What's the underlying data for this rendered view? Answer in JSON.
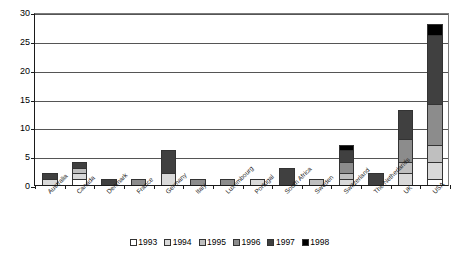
{
  "chart_data": {
    "type": "bar",
    "stacked": true,
    "title": "",
    "subtitle": "",
    "xlabel": "",
    "ylabel": "",
    "ylim": [
      0,
      30
    ],
    "yticks": [
      0,
      5,
      10,
      15,
      20,
      25,
      30
    ],
    "ytick_labels": [
      "0",
      "5",
      "10",
      "15",
      "20",
      "25",
      "30"
    ],
    "grid": true,
    "grid_axis": "y",
    "legend_position": "bottom-center",
    "categories": [
      "Australia",
      "Canada",
      "Denmark",
      "France",
      "Germany",
      "Italy",
      "Luxembourg",
      "Portugal",
      "South Africa",
      "Sweden",
      "Switzerland",
      "The Netherlands",
      "UK",
      "USA"
    ],
    "series": [
      {
        "name": "1993",
        "color": "#ffffff",
        "values": [
          0,
          1,
          0,
          0,
          0,
          0,
          0,
          0,
          0,
          0,
          0,
          0,
          0,
          1
        ]
      },
      {
        "name": "1994",
        "color": "#d9d9d9",
        "values": [
          1,
          1,
          0,
          0,
          2,
          0,
          0,
          1,
          0,
          0,
          1,
          0,
          2,
          3
        ]
      },
      {
        "name": "1995",
        "color": "#bfbfbf",
        "values": [
          0,
          1,
          0,
          0,
          0,
          0,
          0,
          0,
          0,
          1,
          1,
          0,
          2,
          3
        ]
      },
      {
        "name": "1996",
        "color": "#8c8c8c",
        "values": [
          0,
          0,
          0,
          1,
          0,
          1,
          1,
          0,
          0,
          0,
          2,
          0,
          4,
          7
        ]
      },
      {
        "name": "1997",
        "color": "#404040",
        "values": [
          1,
          1,
          1,
          0,
          4,
          0,
          0,
          0,
          3,
          0,
          2,
          2,
          5,
          12
        ]
      },
      {
        "name": "1998",
        "color": "#000000",
        "values": [
          0,
          0,
          0,
          0,
          0,
          0,
          0,
          0,
          0,
          0,
          1,
          0,
          0,
          2
        ]
      }
    ],
    "totals": [
      2,
      4,
      1,
      1,
      6,
      1,
      1,
      1,
      3,
      1,
      7,
      2,
      13,
      28
    ]
  }
}
